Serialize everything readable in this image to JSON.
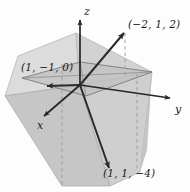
{
  "figure": {
    "background_color": "#fdfdfd",
    "axis_color": "#262626",
    "vector_color": "#2b2b2b",
    "fill_light": "#d9d9d9",
    "fill_mid": "#c9c9c9",
    "fill_dark": "#b9b9b9",
    "dash_color": "#9a9a9a",
    "edge_color": "#8f8f8f"
  },
  "axes": [
    {
      "name": "z-axis",
      "label": "z",
      "direction": "up"
    },
    {
      "name": "y-axis",
      "label": "y",
      "direction": "right"
    },
    {
      "name": "x-axis",
      "label": "x",
      "direction": "down-left"
    }
  ],
  "points": [
    {
      "name": "point-a",
      "label": "(−2, 1, 2)",
      "coords": [
        -2,
        1,
        2
      ]
    },
    {
      "name": "point-b",
      "label": "(1, −1, 0)",
      "coords": [
        1,
        -1,
        0
      ]
    },
    {
      "name": "point-c",
      "label": "(1, 1, −4)",
      "coords": [
        1,
        1,
        -4
      ]
    }
  ]
}
